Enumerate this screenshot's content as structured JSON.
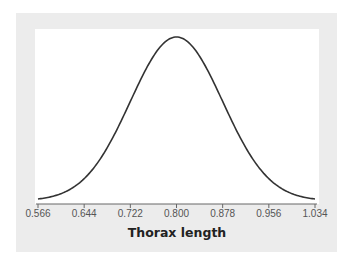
{
  "chart_data": {
    "type": "line",
    "title": "",
    "xlabel": "Thorax length",
    "ylabel": "",
    "distribution": {
      "name": "normal",
      "mean": 0.8,
      "sd": 0.078
    },
    "xlim": [
      0.566,
      1.034
    ],
    "x_ticks": [
      "0.566",
      "0.644",
      "0.722",
      "0.800",
      "0.878",
      "0.956",
      "1.034"
    ],
    "x_tick_values": [
      0.566,
      0.644,
      0.722,
      0.8,
      0.878,
      0.956,
      1.034
    ],
    "grid": false,
    "legend": null,
    "colors": {
      "curve": "#333333",
      "panel_bg": "#ececec",
      "plot_bg": "#ffffff",
      "axis": "#555555"
    }
  }
}
